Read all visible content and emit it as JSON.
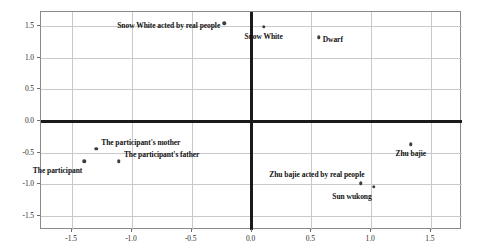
{
  "chart_data": {
    "type": "scatter",
    "title": "",
    "xlabel": "",
    "ylabel": "",
    "xlim": [
      -1.76,
      1.76
    ],
    "ylim": [
      -1.72,
      1.72
    ],
    "grid": true,
    "legend": false,
    "xticks": [
      "-1.5",
      "-1.0",
      "-0.5",
      "0.0",
      "0.5",
      "1.0",
      "1.5"
    ],
    "xtick_values": [
      -1.5,
      -1.0,
      -0.5,
      0.0,
      0.5,
      1.0,
      1.5
    ],
    "yticks": [
      "1.5",
      "1.0",
      "0.5",
      "0.0",
      "-0.5",
      "-1.0",
      "-1.5"
    ],
    "ytick_values": [
      1.5,
      1.0,
      0.5,
      0.0,
      -0.5,
      -1.0,
      -1.5
    ],
    "points": [
      {
        "label": "Snow White acted by real people",
        "x": -0.22,
        "y": 1.53,
        "label_side": "left"
      },
      {
        "label": "Snow White",
        "x": 0.11,
        "y": 1.47,
        "label_side": "below"
      },
      {
        "label": "Dwarf",
        "x": 0.57,
        "y": 1.31,
        "label_side": "right"
      },
      {
        "label": "Zhu bajie",
        "x": 1.34,
        "y": -0.38,
        "label_side": "below"
      },
      {
        "label": "The participant's mother",
        "x": -1.29,
        "y": -0.45,
        "label_side": "above-right"
      },
      {
        "label": "The participant",
        "x": -1.39,
        "y": -0.65,
        "label_side": "below-left"
      },
      {
        "label": "The participant's father",
        "x": -1.1,
        "y": -0.65,
        "label_side": "above-right"
      },
      {
        "label": "Zhu bajie acted by real people",
        "x": 0.92,
        "y": -1.0,
        "label_side": "above-left"
      },
      {
        "label": "Sun wukong",
        "x": 1.03,
        "y": -1.05,
        "label_side": "below-left"
      }
    ]
  }
}
